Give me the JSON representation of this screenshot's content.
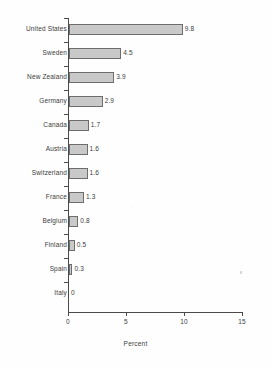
{
  "chart_data": {
    "type": "bar",
    "orientation": "horizontal",
    "title": "",
    "xlabel": "Percent",
    "ylabel": "",
    "xlim": [
      0,
      15
    ],
    "xticks": [
      0,
      5,
      10,
      15
    ],
    "xtick_labels": [
      "0",
      "5",
      "10",
      "15"
    ],
    "grid": false,
    "legend": false,
    "categories": [
      "United States",
      "Sweden",
      "New Zealand",
      "Germany",
      "Canada",
      "Austria",
      "Switzerland",
      "France",
      "Belgium",
      "Finland",
      "Spain",
      "Italy"
    ],
    "values": [
      9.8,
      4.5,
      3.9,
      2.9,
      1.7,
      1.6,
      1.6,
      1.3,
      0.8,
      0.5,
      0.3,
      0
    ],
    "value_labels": [
      "9.8",
      "4.5",
      "3.9",
      "2.9",
      "1.7",
      "1.6",
      "1.6",
      "1.3",
      "0.8",
      "0.5",
      "0.3",
      "0"
    ],
    "colors": {
      "bar_fill": "#c9c9c9",
      "bar_border": "#6d6d6d",
      "axis": "#4a4a4a",
      "text": "#3c3c3c",
      "background": "#fefefe"
    }
  }
}
